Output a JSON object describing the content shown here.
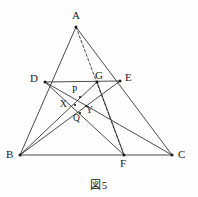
{
  "figure": {
    "caption": "図5",
    "stroke_color": "#2b2b2b",
    "label_color": "#1a1a1a",
    "background": "#fefefe"
  },
  "labels": {
    "A": "A",
    "B": "B",
    "C": "C",
    "D": "D",
    "E": "E",
    "F": "F",
    "G": "G",
    "P": "P",
    "Q": "Q",
    "X": "X",
    "Y": "Y"
  },
  "chart_data": {
    "type": "diagram",
    "title": "図5",
    "points": [
      {
        "name": "A",
        "x": 76,
        "y": 27,
        "label_x": 72,
        "label_y": 10
      },
      {
        "name": "B",
        "x": 20,
        "y": 155,
        "label_x": 6,
        "label_y": 149
      },
      {
        "name": "C",
        "x": 172,
        "y": 155,
        "label_x": 178,
        "label_y": 149
      },
      {
        "name": "D",
        "x": 45,
        "y": 82,
        "label_x": 30,
        "label_y": 73
      },
      {
        "name": "E",
        "x": 120,
        "y": 81,
        "label_x": 125,
        "label_y": 72
      },
      {
        "name": "F",
        "x": 124,
        "y": 155,
        "label_x": 120,
        "label_y": 158
      },
      {
        "name": "G",
        "x": 97,
        "y": 82,
        "label_x": 95,
        "label_y": 70
      },
      {
        "name": "P",
        "x": 80,
        "y": 97,
        "label_x": 72,
        "label_y": 86
      },
      {
        "name": "X",
        "x": 75,
        "y": 105,
        "label_x": 60,
        "label_y": 100
      },
      {
        "name": "Y",
        "x": 86,
        "y": 106,
        "label_x": 86,
        "label_y": 106
      },
      {
        "name": "Q",
        "x": 80,
        "y": 113,
        "label_x": 73,
        "label_y": 114
      }
    ],
    "segments": [
      {
        "from": "A",
        "to": "B",
        "style": "solid"
      },
      {
        "from": "A",
        "to": "C",
        "style": "solid"
      },
      {
        "from": "B",
        "to": "C",
        "style": "solid"
      },
      {
        "from": "D",
        "to": "E",
        "style": "solid"
      },
      {
        "from": "A",
        "to": "F",
        "style": "dashed"
      },
      {
        "from": "D",
        "to": "C",
        "style": "solid"
      },
      {
        "from": "E",
        "to": "B",
        "style": "solid"
      },
      {
        "from": "D",
        "to": "F",
        "style": "solid"
      },
      {
        "from": "G",
        "to": "B",
        "style": "solid"
      },
      {
        "from": "G",
        "to": "F",
        "style": "solid"
      }
    ]
  }
}
